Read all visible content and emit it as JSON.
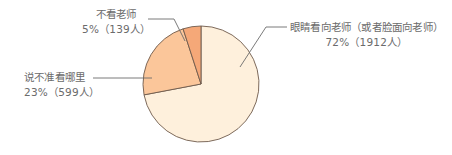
{
  "chart_data": {
    "type": "pie",
    "title": "",
    "categories": [
      "眼睛看向老师（或者脸面向老师）",
      "说不准看哪里",
      "不看老师"
    ],
    "values": [
      72,
      23,
      5
    ],
    "counts": [
      1912,
      599,
      139
    ],
    "unit": "%",
    "start_angle_deg": 0,
    "direction": "clockwise",
    "colors": [
      "#FEF0DC",
      "#FBC69A",
      "#F5A878"
    ],
    "stroke_color": "#6e5a4c",
    "legend": "none (callout labels)"
  },
  "labels": {
    "eye": {
      "name": "眼睛看向老师（或者脸面向老师）",
      "value": "72%（1912人）"
    },
    "unsure": {
      "name": "说不准看哪里",
      "value": "23%（599人）"
    },
    "no": {
      "name": "不看老师",
      "value": "5%（139人）"
    }
  }
}
